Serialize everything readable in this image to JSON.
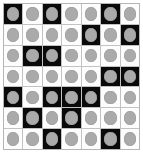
{
  "figure": {
    "rows": 7,
    "columns": 7,
    "colors": {
      "cell_dark": "#0a0a0a",
      "cell_light": "#fdfdfd",
      "disc": "#aaaaaa",
      "grid_line": "#c2c2c2",
      "frame": "#b5b5b5",
      "page_background": "#ffffff"
    },
    "legend": {
      "dark_label": "black",
      "light_label": "white",
      "disc_label": "gray disc"
    }
  },
  "chart_data": {
    "type": "heatmap",
    "xlabel": "",
    "ylabel": "",
    "rows": 7,
    "columns": 7,
    "value_labels": {
      "0": "white",
      "1": "black"
    },
    "row_labels": [
      "1",
      "2",
      "3",
      "4",
      "5",
      "6",
      "7"
    ],
    "column_labels": [
      "1",
      "2",
      "3",
      "4",
      "5",
      "6",
      "7"
    ],
    "matrix": [
      [
        1,
        0,
        1,
        0,
        0,
        1,
        0
      ],
      [
        0,
        0,
        0,
        0,
        1,
        0,
        1
      ],
      [
        0,
        1,
        1,
        0,
        0,
        0,
        0
      ],
      [
        0,
        0,
        0,
        0,
        0,
        1,
        1
      ],
      [
        1,
        0,
        1,
        1,
        1,
        0,
        0
      ],
      [
        0,
        1,
        0,
        1,
        0,
        0,
        0
      ],
      [
        0,
        0,
        1,
        0,
        0,
        1,
        0
      ]
    ],
    "every_cell_has_disc": true,
    "dark_cell_count": 17,
    "light_cell_count": 32,
    "total_cell_count": 49
  }
}
